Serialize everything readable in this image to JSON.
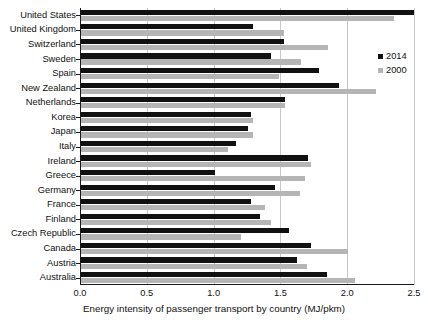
{
  "chart_data": {
    "type": "bar",
    "orientation": "horizontal",
    "title": "",
    "xlabel": "Energy intensity of passenger transport by country (MJ/pkm)",
    "ylabel": "",
    "xlim": [
      0.0,
      2.5
    ],
    "xticks": [
      "0.0",
      "0.5",
      "1.0",
      "1.5",
      "2.0",
      "2.5"
    ],
    "xtick_values": [
      0.0,
      0.5,
      1.0,
      1.5,
      2.0,
      2.5
    ],
    "grid": "vertical",
    "legend_position": "upper right",
    "categories": [
      "United States",
      "United Kingdom",
      "Switzerland",
      "Sweden",
      "Spain",
      "New Zealand",
      "Netherlands",
      "Korea",
      "Japan",
      "Italy",
      "Ireland",
      "Greece",
      "Germany",
      "France",
      "Finland",
      "Czech Republic",
      "Canada",
      "Austria",
      "Australia"
    ],
    "series": [
      {
        "name": "2014",
        "color": "#111111",
        "values": [
          2.49,
          1.29,
          1.52,
          1.42,
          1.78,
          1.93,
          1.53,
          1.27,
          1.25,
          1.16,
          1.7,
          1.0,
          1.45,
          1.27,
          1.34,
          1.56,
          1.72,
          1.62,
          1.84
        ]
      },
      {
        "name": "2000",
        "color": "#b5b5b5",
        "values": [
          2.34,
          1.52,
          1.85,
          1.65,
          1.48,
          2.21,
          1.53,
          1.29,
          1.29,
          1.1,
          1.72,
          1.68,
          1.64,
          1.38,
          1.42,
          1.2,
          2.0,
          1.69,
          2.05
        ]
      }
    ]
  },
  "legend": {
    "entries": [
      {
        "label": "2014",
        "color": "#111111"
      },
      {
        "label": "2000",
        "color": "#b5b5b5"
      }
    ]
  }
}
